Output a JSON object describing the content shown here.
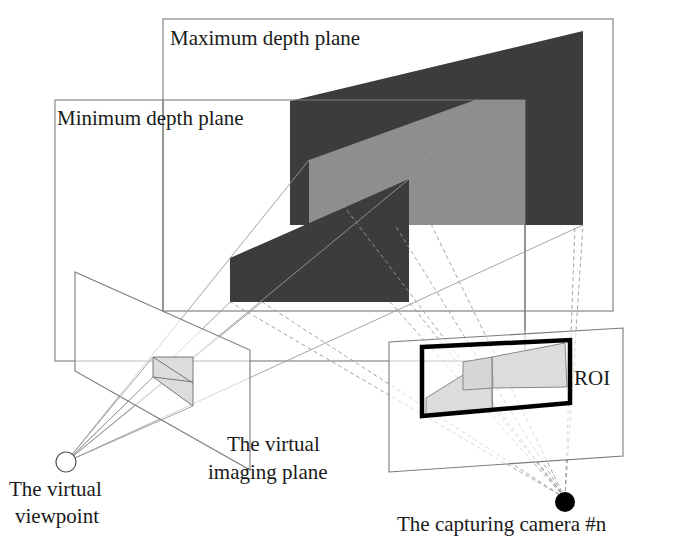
{
  "diagram": {
    "labels": {
      "max_depth_plane": "Maximum depth plane",
      "min_depth_plane": "Minimum depth plane",
      "roi": "ROI",
      "virtual_imaging_plane_line1": "The virtual",
      "virtual_imaging_plane_line2": "imaging plane",
      "virtual_viewpoint_line1": "The virtual",
      "virtual_viewpoint_line2": "viewpoint",
      "capturing_camera": "The capturing camera #n"
    },
    "colors": {
      "dark_object": "#3c3c3c",
      "gray_object": "#8e8e8e",
      "projection_fill": "#dcdcdc",
      "roi_border": "#000000",
      "plane_stroke": "#7a7a7a",
      "camera_dot": "#000000"
    }
  }
}
